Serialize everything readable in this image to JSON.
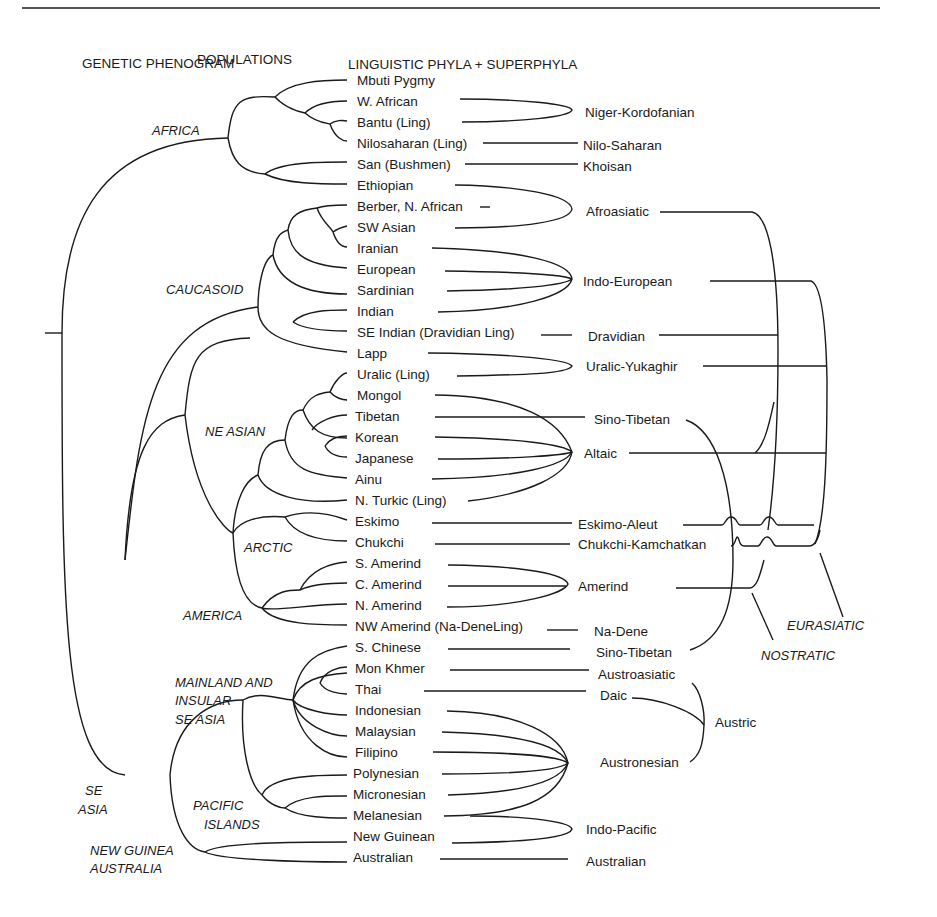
{
  "headers": {
    "left": "GENETIC PHENOGRAM",
    "middle": "POPULATIONS",
    "right": "LINGUISTIC PHYLA + SUPERPHYLA"
  },
  "populations": [
    "Mbuti Pygmy",
    "W. African",
    "Bantu (Ling)",
    "Nilosaharan (Ling)",
    "San (Bushmen)",
    "Ethiopian",
    "Berber, N. African",
    "SW Asian",
    "Iranian",
    "European",
    "Sardinian",
    "Indian",
    "SE Indian (Dravidian Ling)",
    "Lapp",
    "Uralic (Ling)",
    "Mongol",
    "Tibetan",
    "Korean",
    "Japanese",
    "Ainu",
    "N. Turkic (Ling)",
    "Eskimo",
    "Chukchi",
    "S. Amerind",
    "C. Amerind",
    "N. Amerind",
    "NW Amerind (Na-DeneLing)",
    "S. Chinese",
    "Mon Khmer",
    "Thai",
    "Indonesian",
    "Malaysian",
    "Filipino",
    "Polynesian",
    "Micronesian",
    "Melanesian",
    "New Guinean",
    "Australian"
  ],
  "phyla": {
    "niger_kordofanian": "Niger-Kordofanian",
    "nilo_saharan": "Nilo-Saharan",
    "khoisan": "Khoisan",
    "afroasiatic": "Afroasiatic",
    "indo_european": "Indo-European",
    "dravidian": "Dravidian",
    "uralic_yukaghir": "Uralic-Yukaghir",
    "sino_tibetan_1": "Sino-Tibetan",
    "altaic": "Altaic",
    "eskimo_aleut": "Eskimo-Aleut",
    "chukchi_kamchatkan": "Chukchi-Kamchatkan",
    "amerind": "Amerind",
    "na_dene": "Na-Dene",
    "sino_tibetan_2": "Sino-Tibetan",
    "austroasiatic": "Austroasiatic",
    "daic": "Daic",
    "austric": "Austric",
    "austronesian": "Austronesian",
    "indo_pacific": "Indo-Pacific",
    "australian": "Australian"
  },
  "superphyla": {
    "eurasiatic": "EURASIATIC",
    "nostratic": "NOSTRATIC"
  },
  "groups": {
    "africa": "AFRICA",
    "caucasoid": "CAUCASOID",
    "ne_asian": "NE ASIAN",
    "arctic": "ARCTIC",
    "america": "AMERICA",
    "mainland_1": "MAINLAND AND",
    "mainland_2": "INSULAR",
    "mainland_3": "SE ASIA",
    "se_asia_1": "SE",
    "se_asia_2": "ASIA",
    "pacific_1": "PACIFIC",
    "pacific_2": "ISLANDS",
    "ng_1": "NEW GUINEA",
    "ng_2": "AUSTRALIA"
  }
}
